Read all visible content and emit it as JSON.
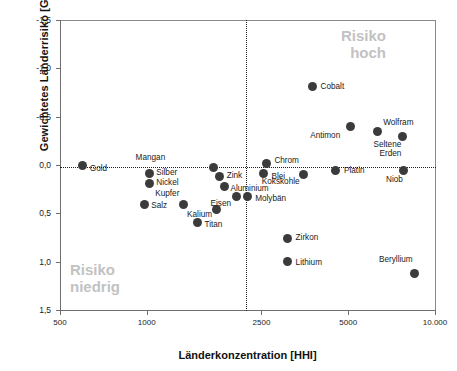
{
  "chart_data": {
    "type": "scatter",
    "title": "",
    "xlabel": "Länderkonzentration [HHI]",
    "ylabel": "Gewichtetes Länderrisiko [GLR]",
    "xscale": "log",
    "xlim": [
      500,
      10000
    ],
    "ylim": [
      -1.5,
      1.5
    ],
    "y_inverted": true,
    "grid": false,
    "legend": null,
    "xticks": [
      "500",
      "1000",
      "2500",
      "5000",
      "10.000"
    ],
    "xtick_values": [
      500,
      1000,
      2500,
      5000,
      10000
    ],
    "yticks": [
      "-1,5",
      "-1,0",
      "-0,5",
      "0,0",
      "0,5",
      "1,0",
      "1,5"
    ],
    "ytick_values": [
      -1.5,
      -1.0,
      -0.5,
      0.0,
      0.5,
      1.0,
      1.5
    ],
    "reference_lines": [
      {
        "axis": "y",
        "value": 0.0,
        "style": "dotted"
      },
      {
        "axis": "x",
        "value": 2200,
        "style": "dotted"
      }
    ],
    "annotations": [
      {
        "text_lines": [
          "Risiko",
          "hoch"
        ],
        "quadrant": "top-right",
        "color": "#c2c2c2"
      },
      {
        "text_lines": [
          "Risiko",
          "niedrig"
        ],
        "quadrant": "bottom-left",
        "color": "#c2c2c2"
      }
    ],
    "marker_color": "#3b3b3b",
    "points": [
      {
        "label": "Gold",
        "x": 600,
        "y": 0.0,
        "lab_dx": 7,
        "lab_dy": 4
      },
      {
        "label": "Silber",
        "x": 1020,
        "y": 0.09,
        "lab_dx": 7,
        "lab_dy": -1
      },
      {
        "label": "Nickel",
        "x": 1020,
        "y": 0.19,
        "lab_dx": 7,
        "lab_dy": 0
      },
      {
        "label": "Salz",
        "x": 980,
        "y": 0.41,
        "lab_dx": 7,
        "lab_dy": 1
      },
      {
        "label": "Kupfer",
        "x": 1340,
        "y": 0.41,
        "lab_dx": -4,
        "lab_dy": -11
      },
      {
        "label": "Titan",
        "x": 1500,
        "y": 0.59,
        "lab_dx": 7,
        "lab_dy": 3
      },
      {
        "label": "Kalium",
        "x": 1740,
        "y": 0.46,
        "lab_dx": -4,
        "lab_dy": 6
      },
      {
        "label": "Mangan",
        "x": 1700,
        "y": 0.03,
        "lab_dx": -48,
        "lab_dy": -10
      },
      {
        "label": "Zink",
        "x": 1790,
        "y": 0.12,
        "lab_dx": 7,
        "lab_dy": -1
      },
      {
        "label": "Aluminium",
        "x": 1860,
        "y": 0.22,
        "lab_dx": 6,
        "lab_dy": 3
      },
      {
        "label": "Eisen",
        "x": 2040,
        "y": 0.33,
        "lab_dx": -5,
        "lab_dy": 7
      },
      {
        "label": "Molybän",
        "x": 2230,
        "y": 0.33,
        "lab_dx": 8,
        "lab_dy": 2
      },
      {
        "label": "Chrom",
        "x": 2600,
        "y": -0.02,
        "lab_dx": 8,
        "lab_dy": -2
      },
      {
        "label": "Blei",
        "x": 2540,
        "y": 0.09,
        "lab_dx": 8,
        "lab_dy": 3
      },
      {
        "label": "Zirkon",
        "x": 3080,
        "y": 0.76,
        "lab_dx": 8,
        "lab_dy": 0
      },
      {
        "label": "Lithium",
        "x": 3080,
        "y": 1.0,
        "lab_dx": 8,
        "lab_dy": 1
      },
      {
        "label": "Kokskohle",
        "x": 3500,
        "y": 0.1,
        "lab_dx": -4,
        "lab_dy": 7
      },
      {
        "label": "Cobalt",
        "x": 3760,
        "y": -0.81,
        "lab_dx": 8,
        "lab_dy": 0
      },
      {
        "label": "Platin",
        "x": 4500,
        "y": 0.06,
        "lab_dx": 9,
        "lab_dy": 0
      },
      {
        "label": "Antimon",
        "x": 5080,
        "y": -0.4,
        "lab_dx": -10,
        "lab_dy": 10
      },
      {
        "label": "Wolfram",
        "x": 6300,
        "y": -0.35,
        "lab_dx": 6,
        "lab_dy": -8
      },
      {
        "label": "Seltene Erden",
        "x": 7700,
        "y": -0.3,
        "lab_dx": -1,
        "lab_dy": 9,
        "two_line": true
      },
      {
        "label": "Niob",
        "x": 7800,
        "y": 0.06,
        "lab_dx": -1,
        "lab_dy": 9
      },
      {
        "label": "Beryllium",
        "x": 8500,
        "y": 1.12,
        "lab_dx": -2,
        "lab_dy": -13
      }
    ]
  }
}
